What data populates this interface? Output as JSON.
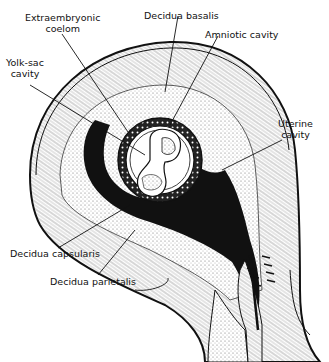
{
  "figure": {
    "labels": [
      {
        "id": "extraembryonic-coelom",
        "line1": "Extraembryonic",
        "line2": "coelom"
      },
      {
        "id": "decidua-basalis",
        "line1": "Decidua basalis",
        "line2": ""
      },
      {
        "id": "amniotic-cavity",
        "line1": "Amniotic cavity",
        "line2": ""
      },
      {
        "id": "yolk-sac-cavity",
        "line1": "Yolk-sac",
        "line2": "cavity"
      },
      {
        "id": "uterine-cavity",
        "line1": "Uterine",
        "line2": "cavity"
      },
      {
        "id": "decidua-capsularis",
        "line1": "Decidua capsularis",
        "line2": ""
      },
      {
        "id": "decidua-parietalis",
        "line1": "Decidua parietalis",
        "line2": ""
      }
    ]
  },
  "colors": {
    "ink": "#111111",
    "background": "#ffffff",
    "stipple": "#bdbdbd"
  }
}
